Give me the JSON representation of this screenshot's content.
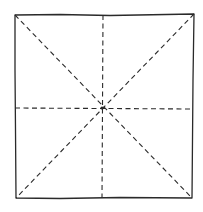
{
  "diagram": {
    "type": "square-fold-lines",
    "stroke_color": "#2a2a2a",
    "background": "#ffffff",
    "square": {
      "corners": {
        "top_left": [
          15,
          15
        ],
        "top_right": [
          194,
          14
        ],
        "bottom_right": [
          192,
          198
        ],
        "bottom_left": [
          16,
          198
        ]
      },
      "line_style": "solid"
    },
    "center": [
      102,
      108
    ],
    "fold_lines": [
      {
        "name": "diagonal-tl-br",
        "from": [
          15,
          15
        ],
        "to": [
          192,
          198
        ],
        "style": "dashed"
      },
      {
        "name": "diagonal-tr-bl",
        "from": [
          194,
          14
        ],
        "to": [
          16,
          198
        ],
        "style": "dashed"
      },
      {
        "name": "vertical-midline",
        "from": [
          103,
          15
        ],
        "to": [
          102,
          198
        ],
        "style": "dashed"
      },
      {
        "name": "horizontal-midline",
        "from": [
          15,
          108
        ],
        "to": [
          193,
          109
        ],
        "style": "dashed"
      }
    ]
  }
}
